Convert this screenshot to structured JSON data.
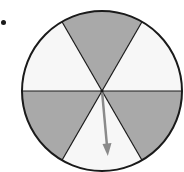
{
  "diagram": {
    "type": "spinner",
    "sections": 6,
    "sections_detail": [
      {
        "position": "top",
        "fill": "shaded"
      },
      {
        "position": "upper-right",
        "fill": "white"
      },
      {
        "position": "lower-right",
        "fill": "shaded"
      },
      {
        "position": "bottom",
        "fill": "white"
      },
      {
        "position": "lower-left",
        "fill": "shaded"
      },
      {
        "position": "upper-left",
        "fill": "white"
      }
    ],
    "shaded_count": 3,
    "white_count": 3,
    "arrow_points_to": "bottom",
    "colors": {
      "shaded": "#a9a9a9",
      "white": "#f7f7f7",
      "outline": "#1a1a1a",
      "arrow": "#8a8a8a"
    }
  }
}
